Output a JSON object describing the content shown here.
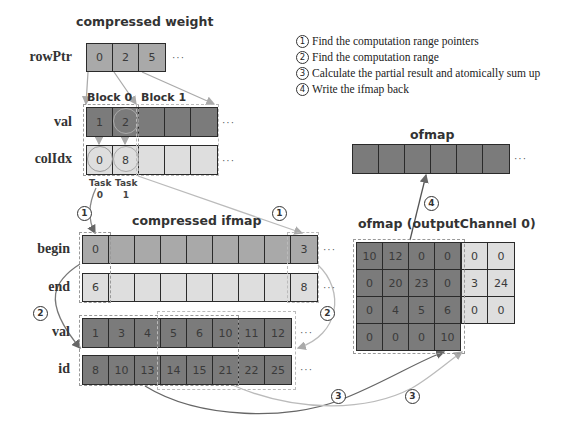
{
  "compressed_weight": {
    "title": "compressed weight",
    "rowPtr": {
      "label": "rowPtr",
      "values": [
        "0",
        "2",
        "5"
      ],
      "ellipsis": "···"
    },
    "blocks": [
      "Block 0",
      "Block 1"
    ],
    "val": {
      "label": "val",
      "values": [
        "1",
        "2",
        "",
        "",
        ""
      ],
      "ellipsis": "···"
    },
    "colIdx": {
      "label": "colIdx",
      "values": [
        "0",
        "8",
        "",
        "",
        ""
      ],
      "ellipsis": "···"
    },
    "tasks": [
      {
        "line1": "Task",
        "line2": "0"
      },
      {
        "line1": "Task",
        "line2": "1"
      }
    ]
  },
  "legend": [
    {
      "num": "1",
      "text": "Find the computation range pointers"
    },
    {
      "num": "2",
      "text": "Find the computation range"
    },
    {
      "num": "3",
      "text": "Calculate the partial result and atomically sum up"
    },
    {
      "num": "4",
      "text": "Write the ifmap back"
    }
  ],
  "compressed_ifmap": {
    "title": "compressed ifmap",
    "begin": {
      "label": "begin",
      "values": [
        "0",
        "",
        "",
        "",
        "",
        "",
        "",
        "",
        "3"
      ],
      "ellipsis": "···"
    },
    "end": {
      "label": "end",
      "values": [
        "6",
        "",
        "",
        "",
        "",
        "",
        "",
        "",
        "8"
      ],
      "ellipsis": "···"
    },
    "val": {
      "label": "val",
      "values": [
        "1",
        "3",
        "4",
        "5",
        "6",
        "10",
        "11",
        "12"
      ],
      "ellipsis": "···"
    },
    "id": {
      "label": "id",
      "values": [
        "8",
        "10",
        "13",
        "14",
        "15",
        "21",
        "22",
        "25"
      ],
      "ellipsis": "···"
    }
  },
  "ofmap": {
    "title": "ofmap",
    "cells": [
      "",
      "",
      "",
      "",
      "",
      ""
    ],
    "ellipsis": "···"
  },
  "ofmap_channel": {
    "title": "ofmap (outputChannel 0)",
    "rows": [
      [
        "10",
        "12",
        "0",
        "0",
        "0",
        "0"
      ],
      [
        "0",
        "20",
        "23",
        "0",
        "3",
        "24"
      ],
      [
        "0",
        "4",
        "5",
        "6",
        "0",
        "0"
      ],
      [
        "0",
        "0",
        "0",
        "10"
      ]
    ]
  },
  "step_markers": {
    "s1a": "1",
    "s1b": "1",
    "s2a": "2",
    "s2b": "2",
    "s3a": "3",
    "s3b": "3",
    "s4": "4"
  }
}
